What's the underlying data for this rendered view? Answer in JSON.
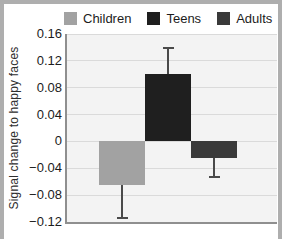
{
  "figure": {
    "title": ""
  },
  "chart_data": {
    "type": "bar",
    "categories": [
      "Children",
      "Teens",
      "Adults"
    ],
    "values": [
      -0.065,
      0.1,
      -0.025
    ],
    "errors": [
      0.05,
      0.04,
      0.03
    ],
    "error_direction": "outward-one-sided",
    "colors": [
      "#a2a2a2",
      "#1f1f1f",
      "#3a3a3a"
    ],
    "error_color": "#4a4a4a",
    "title": "",
    "xlabel": "",
    "ylabel": "Signal change to happy faces",
    "ylim": [
      -0.12,
      0.16
    ],
    "yticks": [
      0.16,
      0.12,
      0.08,
      0.04,
      0,
      -0.04,
      -0.08,
      -0.12
    ],
    "ytick_labels": [
      "0.16",
      "0.12",
      "0.08",
      "0.04",
      "0",
      "−0.04",
      "−0.08",
      "−0.12"
    ],
    "grid": true,
    "legend_position": "top",
    "plot_background": "#f3f3f3",
    "gridline_color": "#dadada",
    "axis_color": "#8f8f8f"
  }
}
